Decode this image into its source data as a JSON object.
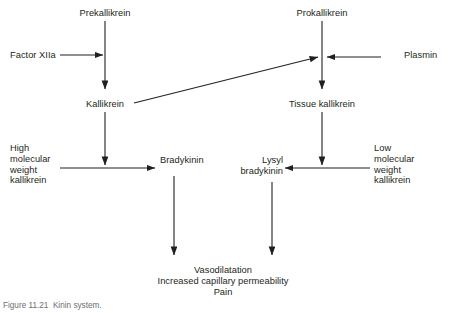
{
  "figure": {
    "caption": "Figure 11.21  Kinin system.",
    "line_color": "#231f20",
    "text_color": "#231f20",
    "background": "#ffffff"
  },
  "nodes": {
    "prekallikrein": {
      "label": "Prekallikrein",
      "x": 105,
      "y": 8
    },
    "factor_xiia": {
      "label": "Factor XIIa",
      "x": 10,
      "y": 50
    },
    "kallikrein": {
      "label": "Kallikrein",
      "x": 105,
      "y": 99
    },
    "hmw_kallikrein": {
      "label": "High\nmolecular\nweight\nkallikrein",
      "x": 10,
      "y": 143
    },
    "bradykinin": {
      "label": "Bradykinin",
      "x": 160,
      "y": 155
    },
    "prokallikrein": {
      "label": "Prokallikrein",
      "x": 322,
      "y": 8
    },
    "plasmin": {
      "label": "Plasmin",
      "x": 404,
      "y": 50
    },
    "tissue_kallikrein": {
      "label": "Tissue kallikrein",
      "x": 322,
      "y": 99
    },
    "lmw_kallikrein": {
      "label": "Low\nmolecular\nweight\nkallikrein",
      "x": 374,
      "y": 143
    },
    "lysyl_bradykinin": {
      "label": "Lysyl\nbradykinin",
      "x": 239,
      "y": 155
    },
    "outcomes": {
      "label": "Vasodilatation\nIncreased capillary permeability\nPain",
      "x": 223,
      "y": 265
    }
  },
  "edges": [
    {
      "name": "prekallikrein-to-kallikrein",
      "from": "prekallikrein",
      "to": "kallikrein"
    },
    {
      "name": "factor-xiia-to-prekallikrein-arrow",
      "from": "factor_xiia",
      "to": "prekallikrein_axis"
    },
    {
      "name": "kallikrein-to-bradykinin-axis",
      "from": "kallikrein",
      "to": "bradykinin_row"
    },
    {
      "name": "hmw-kallikrein-to-bradykinin",
      "from": "hmw_kallikrein",
      "to": "bradykinin"
    },
    {
      "name": "kallikrein-to-prokallikrein-axis",
      "from": "kallikrein",
      "to": "prokallikrein_axis"
    },
    {
      "name": "prokallikrein-to-tissue-kallikrein",
      "from": "prokallikrein",
      "to": "tissue_kallikrein"
    },
    {
      "name": "plasmin-to-prokallikrein-axis",
      "from": "plasmin",
      "to": "prokallikrein_axis"
    },
    {
      "name": "tissue-kallikrein-to-lysyl-row",
      "from": "tissue_kallikrein",
      "to": "lysyl_row"
    },
    {
      "name": "lmw-kallikrein-to-lysyl-bradykinin",
      "from": "lmw_kallikrein",
      "to": "lysyl_bradykinin"
    },
    {
      "name": "bradykinin-to-outcomes",
      "from": "bradykinin",
      "to": "outcomes"
    },
    {
      "name": "lysyl-bradykinin-to-outcomes",
      "from": "lysyl_bradykinin",
      "to": "outcomes"
    }
  ]
}
